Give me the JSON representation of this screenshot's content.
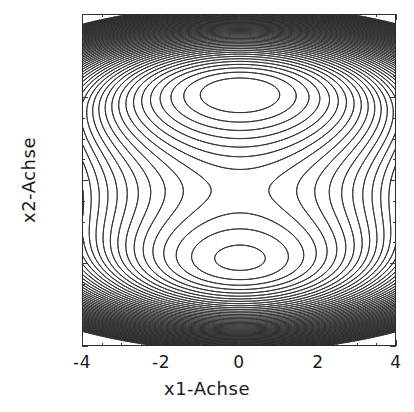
{
  "figure": {
    "background_color": "#fefefe",
    "plot_background_color": "#ffffff",
    "frame_color": "#2b2b2b",
    "line_color": "#2b2b2b"
  },
  "axes": {
    "x": {
      "label": "x1-Achse",
      "ticks": [
        "-4",
        "-2",
        "0",
        "2",
        "4"
      ],
      "tick_values": [
        -4,
        -2,
        0,
        2,
        4
      ],
      "range": [
        -4,
        4
      ]
    },
    "y": {
      "label": "x2-Achse",
      "ticks": [
        "-4",
        "-2",
        "0",
        "2",
        "4"
      ],
      "tick_values": [
        -4,
        -2,
        0,
        2,
        4
      ],
      "range": [
        -4,
        4
      ]
    }
  },
  "chart_data": {
    "type": "line",
    "subtype": "contour",
    "title": "",
    "xlabel": "x1-Achse",
    "ylabel": "x2-Achse",
    "xlim": [
      -4,
      4
    ],
    "ylim": [
      -4,
      4
    ],
    "xticks": [
      -4,
      -2,
      0,
      2,
      4
    ],
    "yticks": [
      -4,
      -2,
      0,
      2,
      4
    ],
    "grid": false,
    "legend": false,
    "contour_count": 60,
    "contour_level_min": -20,
    "contour_level_max": 60,
    "contour_level_step": 1.355932,
    "field_expression": "0.25*x2^4 - 2*x2^2 + 0.5*x1^2 + 0.06*x1^2*x2^2 - 0.9*x2",
    "features": [
      {
        "name": "lower-minimum",
        "kind": "minimum",
        "x1": 0.0,
        "x2": -2.1,
        "description": "deep closed-contour minimum with many concentric rings"
      },
      {
        "name": "upper-minimum",
        "kind": "minimum",
        "x1": 0.0,
        "x2": 1.95,
        "description": "shallow secondary minimum with few closed contours"
      },
      {
        "name": "saddle-center",
        "kind": "saddle",
        "x1": 0.0,
        "x2": 0.2,
        "description": "saddle separating the two minima near x2 = 0.2"
      }
    ]
  }
}
